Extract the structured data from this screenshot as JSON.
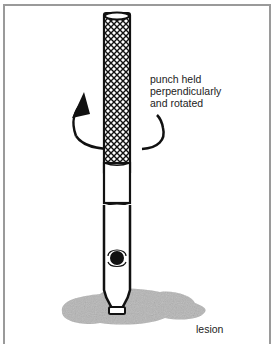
{
  "figure": {
    "annotations": {
      "rotation": [
        "punch held",
        "perpendicularly",
        "and rotated"
      ],
      "lesion": "lesion"
    },
    "colors": {
      "frame": "#9a9a9a",
      "ink": "#111111",
      "lesion": "#b5b5b5"
    }
  }
}
